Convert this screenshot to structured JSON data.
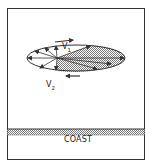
{
  "diagram": {
    "labels": {
      "v1": "V",
      "v1_sub": "1",
      "v2": "V",
      "v2_sub": "2",
      "coast": "COAST"
    },
    "colors": {
      "stroke": "#333333",
      "hatch": "#8a8a8a",
      "background": "#ffffff"
    }
  }
}
